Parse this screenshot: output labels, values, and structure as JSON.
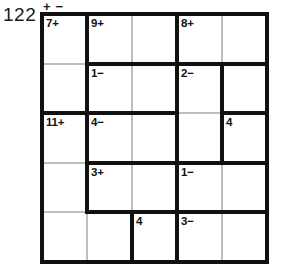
{
  "puzzle": {
    "number": "122",
    "operations_header": [
      "+",
      "−"
    ],
    "grid_size": 5,
    "type": "kenken"
  },
  "chart_data": {
    "type": "table",
    "title": "122",
    "grid_rows": 5,
    "grid_cols": 5,
    "cages": [
      {
        "id": "cage-7plus",
        "label": "7+",
        "value": 7,
        "operation": "+",
        "cells": [
          [
            1,
            1
          ],
          [
            2,
            1
          ]
        ]
      },
      {
        "id": "cage-9plus",
        "label": "9+",
        "value": 9,
        "operation": "+",
        "cells": [
          [
            1,
            2
          ],
          [
            1,
            3
          ]
        ]
      },
      {
        "id": "cage-8plus",
        "label": "8+",
        "value": 8,
        "operation": "+",
        "cells": [
          [
            1,
            4
          ],
          [
            1,
            5
          ]
        ]
      },
      {
        "id": "cage-1minus-a",
        "label": "1−",
        "value": 1,
        "operation": "−",
        "cells": [
          [
            2,
            2
          ],
          [
            2,
            3
          ]
        ]
      },
      {
        "id": "cage-2minus",
        "label": "2−",
        "value": 2,
        "operation": "−",
        "cells": [
          [
            2,
            4
          ],
          [
            3,
            4
          ]
        ]
      },
      {
        "id": "cage-free-r2c5",
        "label": "",
        "value": null,
        "operation": "",
        "cells": [
          [
            2,
            5
          ]
        ]
      },
      {
        "id": "cage-11plus",
        "label": "11+",
        "value": 11,
        "operation": "+",
        "cells": [
          [
            3,
            1
          ],
          [
            4,
            1
          ],
          [
            5,
            1
          ],
          [
            5,
            2
          ]
        ]
      },
      {
        "id": "cage-4minus",
        "label": "4−",
        "value": 4,
        "operation": "−",
        "cells": [
          [
            3,
            2
          ],
          [
            3,
            3
          ]
        ]
      },
      {
        "id": "cage-4single-a",
        "label": "4",
        "value": 4,
        "operation": "",
        "cells": [
          [
            3,
            5
          ]
        ]
      },
      {
        "id": "cage-3plus",
        "label": "3+",
        "value": 3,
        "operation": "+",
        "cells": [
          [
            4,
            2
          ],
          [
            4,
            3
          ]
        ]
      },
      {
        "id": "cage-1minus-b",
        "label": "1−",
        "value": 1,
        "operation": "−",
        "cells": [
          [
            4,
            4
          ],
          [
            4,
            5
          ]
        ]
      },
      {
        "id": "cage-4single-b",
        "label": "4",
        "value": 4,
        "operation": "",
        "cells": [
          [
            5,
            3
          ]
        ]
      },
      {
        "id": "cage-3minus",
        "label": "3−",
        "value": 3,
        "operation": "−",
        "cells": [
          [
            5,
            4
          ],
          [
            5,
            5
          ]
        ]
      }
    ],
    "cell_values": [
      [
        "",
        "",
        "",
        "",
        ""
      ],
      [
        "",
        "",
        "",
        "",
        ""
      ],
      [
        "",
        "",
        "",
        "",
        ""
      ],
      [
        "",
        "",
        "",
        "",
        ""
      ],
      [
        "",
        "",
        "",
        "",
        ""
      ]
    ],
    "labels": {
      "r1c1": "7+",
      "r1c2": "9+",
      "r1c4": "8+",
      "r2c2": "1−",
      "r2c4": "2−",
      "r3c1": "11+",
      "r3c2": "4−",
      "r3c5": "4",
      "r4c2": "3+",
      "r4c4": "1−",
      "r5c3": "4",
      "r5c4": "3−"
    },
    "colors": {
      "cage_border": "#111111",
      "cell_border": "#bdbdbd",
      "background": "#ffffff",
      "text": "#111111"
    }
  }
}
